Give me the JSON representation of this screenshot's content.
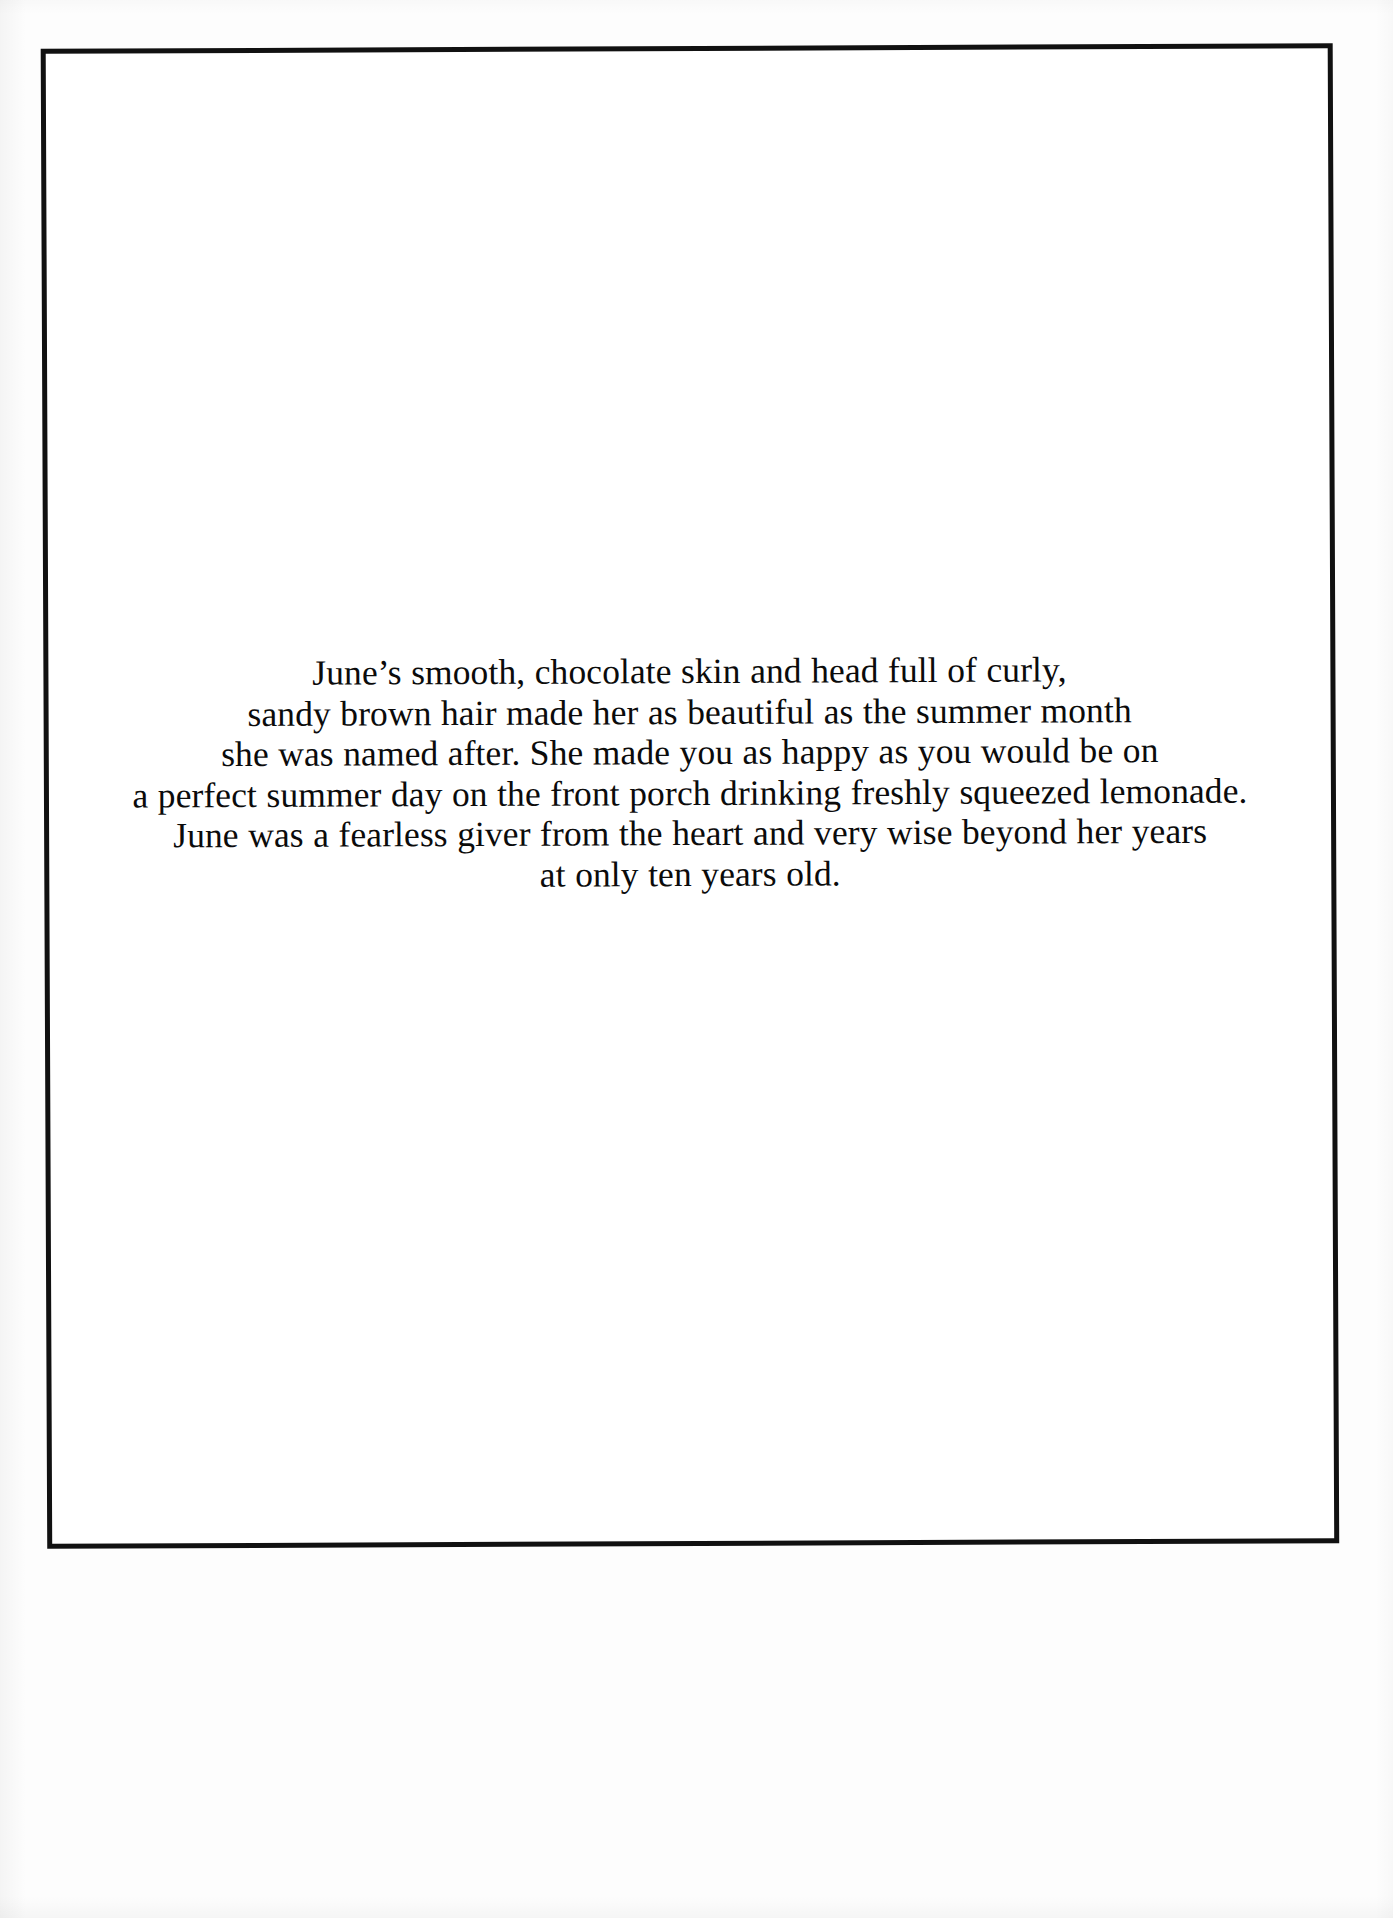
{
  "document": {
    "type": "scanned-book-page",
    "page_background_color": "#ffffff",
    "scan_background_color": "#fdfdfd",
    "border_color": "#111111",
    "text_color": "#0b0b0b",
    "frame": {
      "label": "printed page border"
    },
    "body": {
      "alignment": "center",
      "lines": [
        "June’s smooth, chocolate skin and head full of curly,",
        "sandy brown hair made her as beautiful as the summer month",
        "she was named after. She made you as happy as you would be on",
        "a perfect summer day on the front porch drinking freshly squeezed lemonade.",
        "June was a fearless giver from the heart and very wise beyond her years",
        "at only ten years old."
      ],
      "full_text": "June’s smooth, chocolate skin and head full of curly, sandy brown hair made her as beautiful as the summer month she was named after. She made you as happy as you would be on a perfect summer day on the front porch drinking freshly squeezed lemonade. June was a fearless giver from the heart and very wise beyond her years at only ten years old."
    }
  }
}
